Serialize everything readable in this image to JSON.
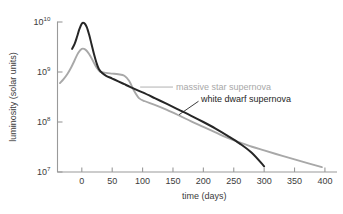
{
  "chart_data": {
    "type": "line",
    "title": "",
    "xlabel": "time (days)",
    "ylabel": "luminosity (solar units)",
    "xlim": [
      -40,
      410
    ],
    "ylim": [
      10000000.0,
      10000000000.0
    ],
    "yscale": "log",
    "xscale": "linear",
    "grid": false,
    "legend_position": "inline-annotations",
    "xticks": [
      0,
      50,
      100,
      150,
      200,
      250,
      300,
      350,
      400
    ],
    "xtick_labels": [
      "0",
      "50",
      "100",
      "150",
      "200",
      "250",
      "300",
      "350",
      "400"
    ],
    "yticks": [
      10000000,
      100000000,
      1000000000,
      10000000000
    ],
    "ytick_labels": [
      "10⁷",
      "10⁸",
      "10⁹",
      "10¹⁰"
    ],
    "ytick_mantissa": [
      "10",
      "10",
      "10",
      "10"
    ],
    "ytick_exponent": [
      "7",
      "8",
      "9",
      "10"
    ],
    "series": [
      {
        "name": "massive star supernova",
        "color": "#a8a8a8",
        "width": 1.9,
        "points": [
          [
            -36,
            600000000.0
          ],
          [
            -30,
            720000000.0
          ],
          [
            -24,
            900000000.0
          ],
          [
            -18,
            1200000000.0
          ],
          [
            -12,
            1700000000.0
          ],
          [
            -6,
            2400000000.0
          ],
          [
            0,
            2900000000.0
          ],
          [
            6,
            2800000000.0
          ],
          [
            12,
            2300000000.0
          ],
          [
            18,
            1700000000.0
          ],
          [
            24,
            1250000000.0
          ],
          [
            30,
            1020000000.0
          ],
          [
            40,
            960000000.0
          ],
          [
            50,
            930000000.0
          ],
          [
            60,
            900000000.0
          ],
          [
            70,
            840000000.0
          ],
          [
            78,
            660000000.0
          ],
          [
            86,
            420000000.0
          ],
          [
            94,
            300000000.0
          ],
          [
            104,
            260000000.0
          ],
          [
            120,
            220000000.0
          ],
          [
            140,
            175000000.0
          ],
          [
            160,
            135000000.0
          ],
          [
            180,
            103000000.0
          ],
          [
            200,
            80000000.0
          ],
          [
            220,
            62000000.0
          ],
          [
            240,
            48000000.0
          ],
          [
            260,
            39000000.0
          ],
          [
            280,
            32000000.0
          ],
          [
            300,
            27000000.0
          ],
          [
            330,
            21000000.0
          ],
          [
            360,
            16500000.0
          ],
          [
            395,
            12500000.0
          ]
        ]
      },
      {
        "name": "white dwarf supernova",
        "color": "#262626",
        "width": 2.0,
        "points": [
          [
            -16,
            2900000000.0
          ],
          [
            -12,
            3600000000.0
          ],
          [
            -8,
            5000000000.0
          ],
          [
            -4,
            7200000000.0
          ],
          [
            0,
            9300000000.0
          ],
          [
            4,
            9500000000.0
          ],
          [
            8,
            8000000000.0
          ],
          [
            12,
            5600000000.0
          ],
          [
            16,
            3600000000.0
          ],
          [
            20,
            2300000000.0
          ],
          [
            24,
            1550000000.0
          ],
          [
            28,
            1150000000.0
          ],
          [
            34,
            940000000.0
          ],
          [
            40,
            840000000.0
          ],
          [
            50,
            740000000.0
          ],
          [
            60,
            650000000.0
          ],
          [
            70,
            570000000.0
          ],
          [
            80,
            500000000.0
          ],
          [
            100,
            390000000.0
          ],
          [
            120,
            300000000.0
          ],
          [
            140,
            230000000.0
          ],
          [
            160,
            175000000.0
          ],
          [
            180,
            133000000.0
          ],
          [
            200,
            100000000.0
          ],
          [
            220,
            74000000.0
          ],
          [
            240,
            53000000.0
          ],
          [
            260,
            37000000.0
          ],
          [
            280,
            24000000.0
          ],
          [
            300,
            13000000.0
          ]
        ]
      }
    ],
    "annotations": [
      {
        "text": "massive star supernova",
        "color": "#a8a8a8",
        "leader_from": [
          96,
          500000000.0
        ],
        "leader_to": [
          150,
          500000000.0
        ],
        "text_anchor": [
          155,
          500000000.0
        ]
      },
      {
        "text": "white dwarf supernova",
        "color": "#262626",
        "leader_from": [
          160,
          140000000.0
        ],
        "leader_to": [
          192,
          260000000.0
        ],
        "text_anchor": [
          196,
          290000000.0
        ]
      }
    ]
  }
}
